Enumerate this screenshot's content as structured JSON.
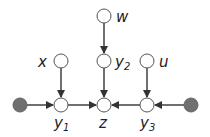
{
  "diagram": {
    "type": "directed-graph",
    "nodes": [
      {
        "id": "w",
        "label": "w",
        "sub": "",
        "observed": false
      },
      {
        "id": "x",
        "label": "x",
        "sub": "",
        "observed": false
      },
      {
        "id": "y2",
        "label": "y",
        "sub": "2",
        "observed": false
      },
      {
        "id": "u",
        "label": "u",
        "sub": "",
        "observed": false
      },
      {
        "id": "left",
        "label": "",
        "sub": "",
        "observed": true
      },
      {
        "id": "y1",
        "label": "y",
        "sub": "1",
        "observed": false
      },
      {
        "id": "z",
        "label": "z",
        "sub": "",
        "observed": false
      },
      {
        "id": "y3",
        "label": "y",
        "sub": "3",
        "observed": false
      },
      {
        "id": "right",
        "label": "",
        "sub": "",
        "observed": true
      }
    ],
    "edges": [
      [
        "w",
        "y2"
      ],
      [
        "x",
        "y1"
      ],
      [
        "y2",
        "z"
      ],
      [
        "u",
        "y3"
      ],
      [
        "left",
        "y1"
      ],
      [
        "y1",
        "z"
      ],
      [
        "y3",
        "z"
      ],
      [
        "right",
        "y3"
      ]
    ],
    "colors": {
      "filled": "#707070",
      "stroke": "#555555",
      "edge": "#333333"
    }
  }
}
